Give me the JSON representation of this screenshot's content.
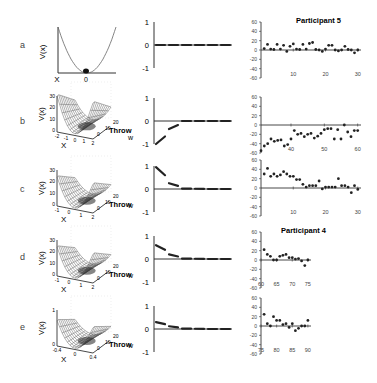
{
  "figure": {
    "row_labels": [
      "a",
      "b",
      "c",
      "d",
      "e"
    ],
    "panel_left": {
      "ylabel": "V(x)",
      "xlabel": "X",
      "zlabel": "Throw",
      "a": {
        "x_ticks": [
          "X",
          "0"
        ]
      },
      "b": {
        "y_ticks": [
          "30",
          "20",
          "10",
          "0"
        ],
        "x_ticks": [
          "-2",
          "-1",
          "0",
          "1",
          "2"
        ],
        "throw_ticks": [
          "20",
          "10",
          "0"
        ]
      },
      "c": {
        "y_ticks": [
          "30",
          "20",
          "10",
          "0"
        ],
        "x_ticks": [
          "-1",
          "0",
          "1",
          "2"
        ],
        "throw_ticks": [
          "20",
          "10",
          "0"
        ]
      },
      "d": {
        "y_ticks": [
          "30",
          "20",
          "10",
          "0"
        ],
        "x_ticks": [
          "-1",
          "0",
          "1",
          "2"
        ],
        "throw_ticks": [
          "20",
          "10",
          "0"
        ]
      },
      "e": {
        "y_ticks": [
          "1",
          "0"
        ],
        "x_ticks": [
          "-0.4",
          "0",
          "0.4"
        ],
        "throw_ticks": [
          "20",
          "10",
          "0"
        ]
      }
    },
    "panel_mid": {
      "ylabel": "w",
      "y_ticks": [
        "1",
        "0",
        "-1"
      ]
    },
    "panel_right": {
      "y_ticks": [
        "60",
        "40",
        "20",
        "0",
        "-20",
        "-40",
        "-60"
      ],
      "titles": {
        "a": "Participant 5",
        "d": "Participant 4"
      }
    }
  },
  "chart_data": [
    {
      "type": "line",
      "title": "Row a left: quadratic potential V(x)",
      "xlabel": "X",
      "ylabel": "V(x)",
      "x": [
        -1,
        -0.5,
        0,
        0.5,
        1
      ],
      "values": [
        1,
        0.25,
        0,
        0.25,
        1
      ]
    },
    {
      "type": "bar",
      "title": "Middle column weights w",
      "ylabel": "w",
      "ylim": [
        -1,
        1
      ],
      "categories": [
        1,
        2,
        3,
        4,
        5,
        6
      ],
      "series": [
        {
          "name": "a",
          "values": [
            0.0,
            0.0,
            0.0,
            0.0,
            0.0,
            0.0
          ]
        },
        {
          "name": "b",
          "values": [
            -1.0,
            -0.35,
            0.0,
            0.0,
            0.0,
            0.0
          ]
        },
        {
          "name": "c",
          "values": [
            0.95,
            0.25,
            0.02,
            0.01,
            0.0,
            0.0
          ]
        },
        {
          "name": "d",
          "values": [
            0.6,
            0.2,
            0.02,
            0.01,
            0.0,
            0.0
          ]
        },
        {
          "name": "e",
          "values": [
            0.3,
            0.12,
            0.02,
            0.01,
            0.0,
            0.0
          ]
        }
      ]
    },
    {
      "type": "scatter",
      "title": "Participant 5",
      "ylim": [
        -60,
        60
      ],
      "series": [
        {
          "name": "a",
          "x_ticks": [
            10,
            20,
            30
          ],
          "xlim": [
            0,
            31
          ],
          "x": [
            1,
            2,
            3,
            4,
            5,
            6,
            7,
            8,
            9,
            10,
            11,
            12,
            13,
            14,
            15,
            16,
            17,
            18,
            19,
            20,
            21,
            22,
            23,
            24,
            25,
            26,
            27,
            28,
            29,
            30
          ],
          "y": [
            3,
            12,
            2,
            1,
            12,
            2,
            10,
            -3,
            8,
            13,
            2,
            1,
            12,
            2,
            14,
            16,
            1,
            0,
            -3,
            2,
            10,
            10,
            0,
            -2,
            0,
            8,
            1,
            0,
            -6,
            0
          ]
        },
        {
          "name": "b",
          "x_ticks": [
            40,
            50,
            60
          ],
          "xlim": [
            31,
            61
          ],
          "x": [
            31,
            32,
            33,
            34,
            35,
            36,
            37,
            38,
            39,
            40,
            41,
            42,
            43,
            44,
            45,
            46,
            47,
            48,
            49,
            50,
            51,
            52,
            53,
            54,
            55,
            56,
            57,
            58,
            59,
            60
          ],
          "y": [
            -55,
            -45,
            -40,
            -30,
            -35,
            -33,
            -32,
            -45,
            -42,
            -30,
            -12,
            -20,
            -18,
            -25,
            -20,
            -18,
            -28,
            -24,
            -18,
            -10,
            -8,
            -8,
            -30,
            -10,
            -30,
            0,
            -15,
            -25,
            -12,
            -12
          ]
        },
        {
          "name": "c",
          "x_ticks": [
            10,
            20,
            30
          ],
          "xlim": [
            0,
            31
          ],
          "x": [
            1,
            2,
            3,
            4,
            5,
            6,
            7,
            8,
            9,
            10,
            11,
            12,
            13,
            14,
            15,
            16,
            17,
            18,
            19,
            20,
            21,
            22,
            23,
            24,
            25,
            26,
            27,
            28,
            29,
            30
          ],
          "y": [
            30,
            42,
            25,
            30,
            25,
            28,
            35,
            30,
            25,
            25,
            18,
            18,
            8,
            2,
            5,
            5,
            5,
            15,
            -2,
            2,
            2,
            2,
            2,
            20,
            5,
            5,
            2,
            -10,
            5,
            -3
          ]
        }
      ]
    },
    {
      "type": "scatter",
      "title": "Participant 4",
      "ylim": [
        -60,
        60
      ],
      "series": [
        {
          "name": "d",
          "x_ticks": [
            60,
            65,
            70,
            75
          ],
          "xlim": [
            60,
            76
          ],
          "x": [
            61,
            62,
            63,
            64,
            65,
            66,
            67,
            68,
            69,
            70,
            71,
            72,
            73,
            74,
            75
          ],
          "y": [
            22,
            12,
            8,
            0,
            0,
            8,
            10,
            12,
            5,
            5,
            2,
            3,
            -2,
            -12,
            0
          ]
        },
        {
          "name": "e",
          "x_ticks": [
            75,
            80,
            85,
            90
          ],
          "xlim": [
            75,
            91
          ],
          "x": [
            76,
            77,
            78,
            79,
            80,
            81,
            82,
            83,
            84,
            85,
            86,
            87,
            88,
            89,
            90
          ],
          "y": [
            25,
            5,
            0,
            20,
            12,
            12,
            3,
            5,
            -3,
            5,
            -10,
            -5,
            0,
            0,
            12
          ]
        }
      ]
    }
  ]
}
